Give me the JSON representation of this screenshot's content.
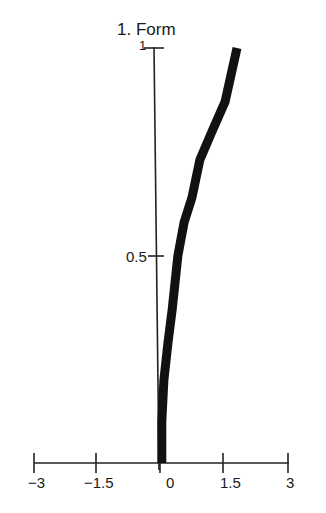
{
  "chart_data": {
    "type": "line",
    "title": "1. Form",
    "xlabel": "",
    "ylabel": "",
    "xlim": [
      -3,
      3
    ],
    "ylim": [
      0,
      1
    ],
    "grid": false,
    "legend": null,
    "x_ticks": [
      "−3",
      "−1.5",
      "0",
      "1.5",
      "3"
    ],
    "y_ticks": [
      "0.5",
      "1"
    ],
    "series": [
      {
        "name": "Form",
        "color": "#111111",
        "x": [
          0.02,
          0.02,
          0.07,
          0.17,
          0.27,
          0.41,
          0.56,
          0.75,
          0.94,
          1.24,
          1.55,
          1.84
        ],
        "y": [
          0.0,
          0.1,
          0.2,
          0.29,
          0.37,
          0.5,
          0.58,
          0.64,
          0.73,
          0.8,
          0.87,
          1.0
        ]
      }
    ]
  }
}
